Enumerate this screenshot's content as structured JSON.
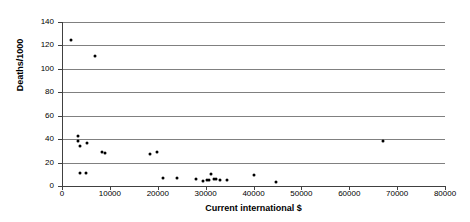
{
  "chart_data": {
    "type": "scatter",
    "title": "",
    "xlabel": "Current international $",
    "ylabel": "Deaths/1000",
    "xlim": [
      0,
      80000
    ],
    "ylim": [
      0,
      140
    ],
    "xticks": [
      0,
      10000,
      20000,
      30000,
      40000,
      50000,
      60000,
      70000,
      80000
    ],
    "xtick_labels": [
      "0",
      "10000",
      "20000",
      "30000",
      "40000",
      "50000",
      "60000",
      "70000",
      "80000"
    ],
    "yticks": [
      0,
      20,
      40,
      60,
      80,
      100,
      120,
      140
    ],
    "ytick_labels": [
      "0",
      "20",
      "40",
      "60",
      "80",
      "100",
      "120",
      "140"
    ],
    "grid": "horizontal",
    "legend": null,
    "marker_color": "#000000",
    "gridline_color": "#808080",
    "axis_color": "#404040",
    "points": [
      {
        "x": 1900,
        "y": 125
      },
      {
        "x": 6900,
        "y": 111
      },
      {
        "x": 3300,
        "y": 43
      },
      {
        "x": 3300,
        "y": 38
      },
      {
        "x": 3800,
        "y": 34
      },
      {
        "x": 5200,
        "y": 37
      },
      {
        "x": 8400,
        "y": 29
      },
      {
        "x": 9000,
        "y": 28
      },
      {
        "x": 3800,
        "y": 11
      },
      {
        "x": 5000,
        "y": 11
      },
      {
        "x": 18400,
        "y": 27
      },
      {
        "x": 19800,
        "y": 29
      },
      {
        "x": 21200,
        "y": 7
      },
      {
        "x": 24100,
        "y": 7
      },
      {
        "x": 28000,
        "y": 6
      },
      {
        "x": 29400,
        "y": 4
      },
      {
        "x": 30300,
        "y": 5
      },
      {
        "x": 30800,
        "y": 5
      },
      {
        "x": 31200,
        "y": 10
      },
      {
        "x": 31700,
        "y": 6
      },
      {
        "x": 32200,
        "y": 6
      },
      {
        "x": 33100,
        "y": 5
      },
      {
        "x": 34500,
        "y": 5
      },
      {
        "x": 40000,
        "y": 9
      },
      {
        "x": 44800,
        "y": 3
      },
      {
        "x": 67000,
        "y": 38
      }
    ]
  }
}
